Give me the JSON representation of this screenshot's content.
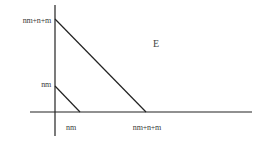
{
  "diagram": {
    "colors": {
      "background": "#ffffff",
      "line": "#222222",
      "text": "#3a3a3a"
    },
    "axes": {
      "y_axis": {
        "x": 55,
        "y1": 5,
        "y2": 136
      },
      "x_axis": {
        "y": 112,
        "x1": 30,
        "x2": 252
      }
    },
    "y_labels": [
      {
        "text": "nm+n+m",
        "y": 21
      },
      {
        "text": "nm",
        "y": 85
      }
    ],
    "x_labels": [
      {
        "text": "nm",
        "x": 71
      },
      {
        "text": "nm+n+m",
        "x": 147
      }
    ],
    "lines": [
      {
        "name": "outer-line",
        "from": [
          55,
          19
        ],
        "to": [
          146,
          112
        ]
      },
      {
        "name": "inner-line",
        "from": [
          55,
          86
        ],
        "to": [
          80,
          112
        ]
      }
    ],
    "region_label": {
      "text": "E",
      "x": 153,
      "y": 39
    }
  }
}
